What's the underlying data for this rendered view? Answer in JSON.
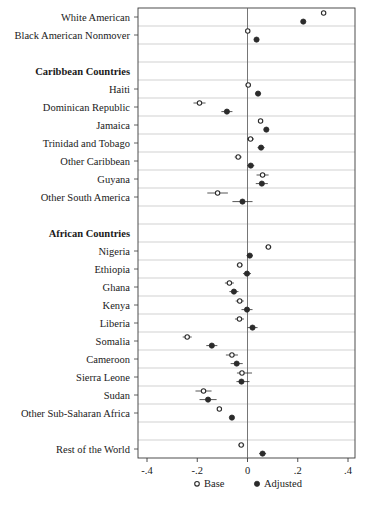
{
  "chart_data": {
    "type": "scatter",
    "title": "",
    "subtitle": "",
    "xlabel": "",
    "ylabel": "",
    "xlim": [
      -0.4,
      0.4
    ],
    "xticks": [
      -0.4,
      -0.2,
      0,
      0.2,
      0.4
    ],
    "xticklabels": [
      "-.4",
      "-.2",
      "0",
      ".2",
      ".4"
    ],
    "grid": true,
    "zero_reference_line": 0,
    "legend_position": "bottom-center",
    "legend": [
      {
        "name": "Base",
        "marker": "open-circle"
      },
      {
        "name": "Adjusted",
        "marker": "filled-circle"
      }
    ],
    "series": [
      {
        "name": "Base",
        "marker": "open-circle"
      },
      {
        "name": "Adjusted",
        "marker": "filled-circle"
      }
    ],
    "rows": [
      {
        "label": "White American",
        "type": "data",
        "base": 0.303,
        "base_lo": 0.297,
        "base_hi": 0.309,
        "adjusted": 0.222,
        "adj_lo": 0.216,
        "adj_hi": 0.228
      },
      {
        "label": "Black American Nonmover",
        "type": "data",
        "base": 0.001,
        "base_lo": -0.004,
        "base_hi": 0.006,
        "adjusted": 0.036,
        "adj_lo": 0.031,
        "adj_hi": 0.041
      },
      {
        "label": "",
        "type": "spacer"
      },
      {
        "label": "Caribbean Countries",
        "type": "header"
      },
      {
        "label": "Haiti",
        "type": "data",
        "base": 0.003,
        "base_lo": -0.008,
        "base_hi": 0.014,
        "adjusted": 0.042,
        "adj_lo": 0.031,
        "adj_hi": 0.053
      },
      {
        "label": "Dominican Republic",
        "type": "data",
        "base": -0.191,
        "base_lo": -0.215,
        "base_hi": -0.167,
        "adjusted": -0.082,
        "adj_lo": -0.104,
        "adj_hi": -0.06
      },
      {
        "label": "Jamaica",
        "type": "data",
        "base": 0.052,
        "base_lo": 0.044,
        "base_hi": 0.06,
        "adjusted": 0.075,
        "adj_lo": 0.067,
        "adj_hi": 0.083
      },
      {
        "label": "Trinidad and Tobago",
        "type": "data",
        "base": 0.012,
        "base_lo": -0.002,
        "base_hi": 0.026,
        "adjusted": 0.054,
        "adj_lo": 0.04,
        "adj_hi": 0.068
      },
      {
        "label": "Other Caribbean",
        "type": "data",
        "base": -0.037,
        "base_lo": -0.051,
        "base_hi": -0.023,
        "adjusted": 0.013,
        "adj_lo": -0.001,
        "adj_hi": 0.027
      },
      {
        "label": "Guyana",
        "type": "data",
        "base": 0.06,
        "base_lo": 0.036,
        "base_hi": 0.084,
        "adjusted": 0.057,
        "adj_lo": 0.033,
        "adj_hi": 0.081
      },
      {
        "label": "Other South America",
        "type": "data",
        "base": -0.119,
        "base_lo": -0.16,
        "base_hi": -0.078,
        "adjusted": -0.02,
        "adj_lo": -0.06,
        "adj_hi": 0.02
      },
      {
        "label": "",
        "type": "spacer"
      },
      {
        "label": "African Countries",
        "type": "header"
      },
      {
        "label": "Nigeria",
        "type": "data",
        "base": 0.083,
        "base_lo": 0.071,
        "base_hi": 0.095,
        "adjusted": 0.009,
        "adj_lo": -0.003,
        "adj_hi": 0.021
      },
      {
        "label": "Ethiopia",
        "type": "data",
        "base": -0.031,
        "base_lo": -0.043,
        "base_hi": -0.019,
        "adjusted": -0.002,
        "adj_lo": -0.018,
        "adj_hi": 0.014
      },
      {
        "label": "Ghana",
        "type": "data",
        "base": -0.072,
        "base_lo": -0.09,
        "base_hi": -0.054,
        "adjusted": -0.054,
        "adj_lo": -0.072,
        "adj_hi": -0.036
      },
      {
        "label": "Kenya",
        "type": "data",
        "base": -0.031,
        "base_lo": -0.047,
        "base_hi": -0.015,
        "adjusted": -0.002,
        "adj_lo": -0.024,
        "adj_hi": 0.02
      },
      {
        "label": "Liberia",
        "type": "data",
        "base": -0.032,
        "base_lo": -0.05,
        "base_hi": -0.014,
        "adjusted": 0.02,
        "adj_lo": 0.0,
        "adj_hi": 0.04
      },
      {
        "label": "Somalia",
        "type": "data",
        "base": -0.24,
        "base_lo": -0.258,
        "base_hi": -0.222,
        "adjusted": -0.142,
        "adj_lo": -0.164,
        "adj_hi": -0.12
      },
      {
        "label": "Cameroon",
        "type": "data",
        "base": -0.062,
        "base_lo": -0.086,
        "base_hi": -0.038,
        "adjusted": -0.043,
        "adj_lo": -0.067,
        "adj_hi": -0.019
      },
      {
        "label": "Sierra Leone",
        "type": "data",
        "base": -0.022,
        "base_lo": -0.042,
        "base_hi": 0.018,
        "adjusted": -0.024,
        "adj_lo": -0.044,
        "adj_hi": 0.008
      },
      {
        "label": "Sudan",
        "type": "data",
        "base": -0.175,
        "base_lo": -0.207,
        "base_hi": -0.143,
        "adjusted": -0.157,
        "adj_lo": -0.191,
        "adj_hi": -0.123
      },
      {
        "label": "Other Sub-Saharan Africa",
        "type": "data",
        "base": -0.112,
        "base_lo": -0.12,
        "base_hi": -0.104,
        "adjusted": -0.062,
        "adj_lo": -0.07,
        "adj_hi": -0.054
      },
      {
        "label": "",
        "type": "spacer"
      },
      {
        "label": "Rest of the World",
        "type": "data",
        "base": -0.025,
        "base_lo": -0.037,
        "base_hi": -0.013,
        "adjusted": 0.06,
        "adj_lo": 0.046,
        "adj_hi": 0.074
      }
    ]
  }
}
